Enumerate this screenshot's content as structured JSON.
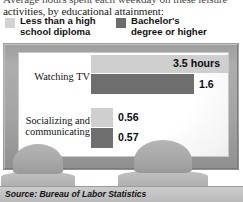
{
  "deck": {
    "line1": "Average hours spent each weekday on these leisure",
    "line2": "activities, by educational attainment:"
  },
  "legend": {
    "items": [
      {
        "label_line1": "Less than a high",
        "label_line2": "school diploma",
        "swatch": "light-gray-swatch-icon",
        "color": "#d2d2d2"
      },
      {
        "label_line1": "Bachelor's",
        "label_line2": "degree or higher",
        "swatch": "dark-gray-swatch-icon",
        "color": "#6c6c6c"
      }
    ]
  },
  "chart_data": {
    "type": "bar",
    "title": "Average hours spent each weekday on these leisure activities, by educational attainment:",
    "orientation": "horizontal",
    "categories": [
      "Watching TV",
      "Socializing and communicating"
    ],
    "series": [
      {
        "name": "Less than a high school diploma",
        "color": "#cfcfcf",
        "values": [
          3.5,
          0.56
        ],
        "labels": [
          "3.5 hours",
          "0.56"
        ]
      },
      {
        "name": "Bachelor's degree or higher",
        "color": "#6e6e6e",
        "values": [
          1.6,
          0.57
        ],
        "labels": [
          "1.6",
          "0.57"
        ]
      }
    ],
    "xlabel": "",
    "ylabel": "",
    "xlim": [
      0,
      3.5
    ],
    "grid": false,
    "legend_position": "top",
    "units": "hours"
  },
  "categories": {
    "tv": {
      "line1": "Watching TV",
      "line2": ""
    },
    "social": {
      "line1": "Socializing and",
      "line2": "communicating"
    }
  },
  "values": {
    "tv_light": "3.5 hours",
    "tv_dark": "1.6",
    "social_light": "0.56",
    "social_dark": "0.57"
  },
  "source": "Source: Bureau of Labor Statistics",
  "decor": {
    "tv_frame": "television-frame-icon",
    "viewer_left": "viewer-silhouette-icon",
    "viewer_right": "viewer-silhouette-icon"
  }
}
